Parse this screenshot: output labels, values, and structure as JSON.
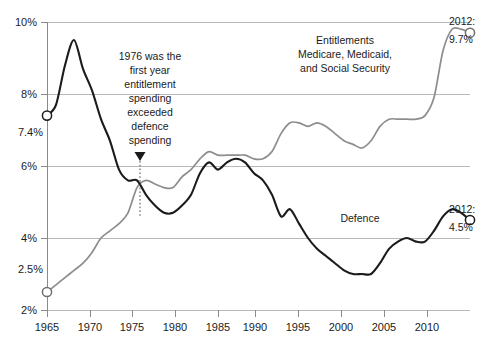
{
  "chart_data": {
    "type": "line",
    "title": "",
    "subtitle": "",
    "xlabel": "",
    "ylabel": "",
    "xlim": [
      1965,
      2012
    ],
    "ylim": [
      2,
      10
    ],
    "grid": true,
    "legend_position": "inline-annotations",
    "y_ticks": [
      "2%",
      "4%",
      "6%",
      "8%",
      "10%"
    ],
    "y_tick_values": [
      2,
      4,
      6,
      8,
      10
    ],
    "x_ticks": [
      "1965",
      "1970",
      "1975",
      "1980",
      "1985",
      "1990",
      "1995",
      "2000",
      "2005",
      "2010"
    ],
    "x_tick_values": [
      1965,
      1970,
      1975,
      1980,
      1985,
      1990,
      1995,
      2000,
      2005,
      2010
    ],
    "extra_y_labels": [
      {
        "text": "7.4%",
        "value": 7.4
      },
      {
        "text": "2.5%",
        "value": 2.5
      }
    ],
    "series": [
      {
        "name": "Defence",
        "label": "Defence",
        "color": "#1b1b1b",
        "start_label": "7.4%",
        "end_label_year": "2012:",
        "end_label_value": "4.5%",
        "x": [
          1965,
          1966,
          1967,
          1968,
          1969,
          1970,
          1971,
          1972,
          1973,
          1974,
          1975,
          1976,
          1977,
          1978,
          1979,
          1980,
          1981,
          1982,
          1983,
          1984,
          1985,
          1986,
          1987,
          1988,
          1989,
          1990,
          1991,
          1992,
          1993,
          1994,
          1995,
          1996,
          1997,
          1998,
          1999,
          2000,
          2001,
          2002,
          2003,
          2004,
          2005,
          2006,
          2007,
          2008,
          2009,
          2010,
          2011,
          2012
        ],
        "values": [
          7.4,
          7.7,
          8.8,
          9.5,
          8.7,
          8.1,
          7.3,
          6.7,
          5.9,
          5.6,
          5.6,
          5.2,
          4.9,
          4.7,
          4.7,
          4.9,
          5.2,
          5.8,
          6.1,
          5.9,
          6.1,
          6.2,
          6.1,
          5.8,
          5.6,
          5.2,
          4.6,
          4.8,
          4.4,
          4.0,
          3.7,
          3.5,
          3.3,
          3.1,
          3.0,
          3.0,
          3.0,
          3.3,
          3.7,
          3.9,
          4.0,
          3.9,
          3.9,
          4.2,
          4.6,
          4.8,
          4.7,
          4.5
        ]
      },
      {
        "name": "Entitlements",
        "label": "Entitlements\nMedicare, Medicaid,\nand Social Security",
        "label_line1": "Entitlements",
        "label_line2": "Medicare, Medicaid,",
        "label_line3": "and Social Security",
        "color": "#8d8d8d",
        "start_label": "2.5%",
        "end_label_year": "2012:",
        "end_label_value": "9.7%",
        "x": [
          1965,
          1966,
          1967,
          1968,
          1969,
          1970,
          1971,
          1972,
          1973,
          1974,
          1975,
          1976,
          1977,
          1978,
          1979,
          1980,
          1981,
          1982,
          1983,
          1984,
          1985,
          1986,
          1987,
          1988,
          1989,
          1990,
          1991,
          1992,
          1993,
          1994,
          1995,
          1996,
          1997,
          1998,
          1999,
          2000,
          2001,
          2002,
          2003,
          2004,
          2005,
          2006,
          2007,
          2008,
          2009,
          2010,
          2011,
          2012
        ],
        "values": [
          2.5,
          2.7,
          2.9,
          3.1,
          3.3,
          3.6,
          4.0,
          4.2,
          4.4,
          4.7,
          5.4,
          5.6,
          5.5,
          5.4,
          5.4,
          5.7,
          5.9,
          6.2,
          6.4,
          6.3,
          6.3,
          6.3,
          6.3,
          6.2,
          6.2,
          6.4,
          6.9,
          7.2,
          7.2,
          7.1,
          7.2,
          7.1,
          6.9,
          6.7,
          6.6,
          6.5,
          6.7,
          7.1,
          7.3,
          7.3,
          7.3,
          7.3,
          7.4,
          7.9,
          9.2,
          9.8,
          9.8,
          9.7
        ]
      }
    ],
    "annotations": [
      {
        "id": "crossover-note",
        "line1": "1976 was the",
        "line2": "first year",
        "line3": "entitlement",
        "line4": "spending",
        "line5": "exceeded",
        "line6": "defence",
        "line7": "spending",
        "pointer_year": 1976,
        "pointer_value": 5.5
      }
    ]
  }
}
